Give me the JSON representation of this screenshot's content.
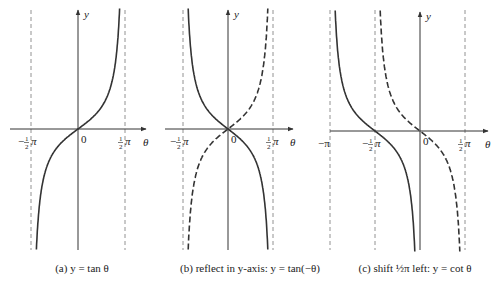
{
  "chart_data": [
    {
      "id": "a",
      "type": "line",
      "title": "(a) y = tan θ",
      "caption": {
        "tag": "(a)",
        "text": "y = tan θ"
      },
      "xlabel": "θ",
      "ylabel": "y",
      "origin_label": "0",
      "tick_labels": [
        {
          "value": -0.5,
          "label": "−½π"
        },
        {
          "value": 0.5,
          "label": "½π"
        }
      ],
      "asymptotes_pi": [
        -0.5,
        0.5
      ],
      "series": [
        {
          "name": "tan θ",
          "function": "tan(θ)",
          "domain_pi": [
            -0.5,
            0.5
          ],
          "style": "solid"
        }
      ]
    },
    {
      "id": "b",
      "type": "line",
      "title": "(b) reflect in y-axis: y = tan(−θ)",
      "caption": {
        "tag": "(b)",
        "text": "reflect in y-axis:  y = tan(−θ)"
      },
      "xlabel": "θ",
      "ylabel": "y",
      "origin_label": "0",
      "tick_labels": [
        {
          "value": -0.5,
          "label": "−½π"
        },
        {
          "value": 0.5,
          "label": "½π"
        }
      ],
      "asymptotes_pi": [
        -0.5,
        0.5
      ],
      "series": [
        {
          "name": "tan(−θ)",
          "function": "tan(-θ)",
          "domain_pi": [
            -0.5,
            0.5
          ],
          "style": "solid"
        },
        {
          "name": "tan θ (original)",
          "function": "tan(θ)",
          "domain_pi": [
            -0.5,
            0.5
          ],
          "style": "dashed"
        }
      ]
    },
    {
      "id": "c",
      "type": "line",
      "title": "(c) shift ½π left: y = cot θ",
      "caption": {
        "tag": "(c)",
        "text": "shift ½π left:  y = cot θ"
      },
      "xlabel": "θ",
      "ylabel": "y",
      "origin_label": "0",
      "tick_labels": [
        {
          "value": -1,
          "label": "−π"
        },
        {
          "value": -0.5,
          "label": "−½π"
        },
        {
          "value": 0.5,
          "label": "½π"
        }
      ],
      "asymptotes_pi": [
        -1,
        -0.5,
        0.5
      ],
      "series": [
        {
          "name": "cot θ = tan(−(θ+½π))",
          "function": "tan(-(θ+π/2))",
          "domain_pi": [
            -1,
            0
          ],
          "style": "solid"
        },
        {
          "name": "tan(−θ) (before shift)",
          "function": "tan(-θ)",
          "domain_pi": [
            -0.5,
            0.5
          ],
          "style": "dashed"
        }
      ]
    }
  ],
  "layout": {
    "panels": [
      {
        "id": "a",
        "origin_x": 78,
        "origin_y": 129,
        "half_period_px": 47,
        "x_axis": [
          10,
          146
        ],
        "y_axis_top": 10,
        "y_axis_bottom": 250,
        "caption_x": 82
      },
      {
        "id": "b",
        "origin_x": 228,
        "origin_y": 129,
        "half_period_px": 45,
        "x_axis": [
          165,
          293
        ],
        "y_axis_top": 10,
        "y_axis_bottom": 250,
        "caption_x": 250
      },
      {
        "id": "c",
        "origin_x": 420,
        "origin_y": 131,
        "half_period_px": 45,
        "x_axis": [
          330,
          488
        ],
        "y_axis_top": 12,
        "y_axis_bottom": 250,
        "caption_x": 415
      }
    ],
    "y_scale_px": 22,
    "y_clip": [
      10,
      250
    ],
    "caption_y": 272
  }
}
